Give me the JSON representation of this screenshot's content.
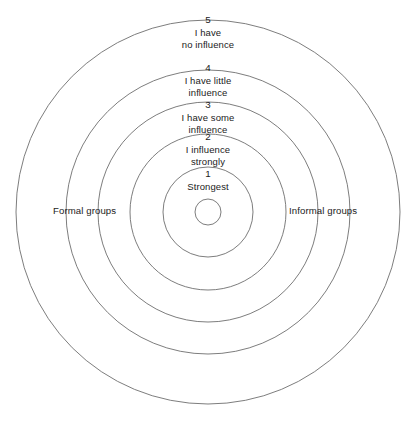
{
  "diagram": {
    "geometry": {
      "center_x": 208,
      "center_y": 212,
      "stroke_color": "#6e6e6e",
      "background_color": "#ffffff",
      "radii": [
        13,
        45,
        78,
        110,
        142,
        192
      ]
    },
    "side_labels": {
      "left": "Formal groups",
      "right": "Informal groups"
    },
    "rings": [
      {
        "number": "5",
        "line1": "I have",
        "line2": "no influence"
      },
      {
        "number": "4",
        "line1": "I have little",
        "line2": "influence"
      },
      {
        "number": "3",
        "line1": "I have some",
        "line2": "influence"
      },
      {
        "number": "2",
        "line1": "I influence",
        "line2": "strongly"
      },
      {
        "number": "1",
        "line1": "Strongest",
        "line2": ""
      }
    ]
  }
}
